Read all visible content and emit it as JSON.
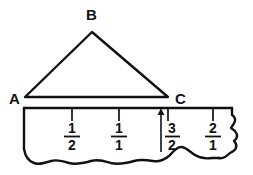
{
  "figure": {
    "ink_color": "#111111",
    "paper_color": "#ffffff",
    "triangle": {
      "name": "triangle-abc",
      "vertices": [
        {
          "label": "A",
          "x": 25,
          "y": 97,
          "label_x": 9,
          "label_y": 103
        },
        {
          "label": "B",
          "x": 92,
          "y": 32,
          "label_x": 92,
          "label_y": 19
        },
        {
          "label": "C",
          "x": 168,
          "y": 97,
          "label_x": 177,
          "label_y": 103
        }
      ],
      "base_label": "AC"
    },
    "ruler": {
      "name": "fraction-ruler",
      "top_y": 108,
      "left_x": 24,
      "right_x": 232,
      "tick_length": 10,
      "ticks": [
        {
          "x": 72,
          "numerator": "1",
          "denominator": "2",
          "arrow": false
        },
        {
          "x": 119,
          "numerator": "1",
          "denominator": "1",
          "arrow": false
        },
        {
          "x": 168,
          "numerator": "3",
          "denominator": "2",
          "arrow": true
        },
        {
          "x": 213,
          "numerator": "2",
          "denominator": "1",
          "arrow": false
        }
      ],
      "arrow_marker": {
        "name": "up-arrow-at-three-halves",
        "x": 161,
        "tip_y": 109,
        "tail_y": 152,
        "points_to": "C"
      }
    },
    "edges": {
      "right_torn": "wavy torn paper edge",
      "bottom_torn": "wavy torn paper edge"
    }
  }
}
